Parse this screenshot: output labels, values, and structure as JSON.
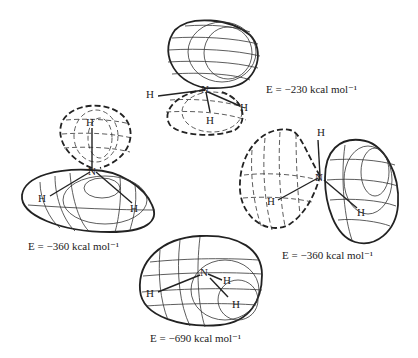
{
  "figure": {
    "molecule": "NH3",
    "orbitals": [
      {
        "id": "top",
        "energy_label": "E = −230 kcal mol⁻¹",
        "atoms": [
          "N",
          "H",
          "H",
          "H"
        ]
      },
      {
        "id": "left",
        "energy_label": "E = −360 kcal mol⁻¹",
        "atoms": [
          "N",
          "H",
          "H",
          "H"
        ]
      },
      {
        "id": "right",
        "energy_label": "E = −360 kcal mol⁻¹",
        "atoms": [
          "N",
          "H",
          "H",
          "H"
        ]
      },
      {
        "id": "bottom",
        "energy_label": "E = −690 kcal mol⁻¹",
        "atoms": [
          "N",
          "H",
          "H",
          "H"
        ]
      }
    ]
  }
}
